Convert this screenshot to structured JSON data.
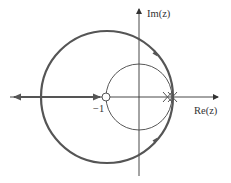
{
  "diagram": {
    "type": "root-locus",
    "axes": {
      "x_label": "Re(z)",
      "y_label": "Im(z)"
    },
    "marks": {
      "zero_label": "−1"
    },
    "colors": {
      "locus": "#555555",
      "axis": "#333333",
      "unit_circle": "#444444",
      "background": "#ffffff"
    },
    "elements": [
      {
        "name": "unit-circle",
        "kind": "circle",
        "center": [
          0,
          0
        ],
        "radius": 1
      },
      {
        "name": "root-locus-circle",
        "kind": "circle",
        "direction": "arrows on branch"
      },
      {
        "name": "real-axis-locus",
        "kind": "segment",
        "from": "-1",
        "to": "-infinity"
      },
      {
        "name": "zero",
        "kind": "open-circle",
        "at": -1
      },
      {
        "name": "poles",
        "kind": "cross",
        "count": 2
      }
    ]
  }
}
